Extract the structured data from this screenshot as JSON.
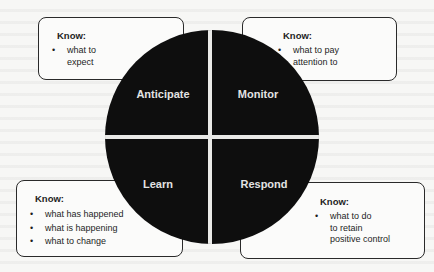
{
  "diagram": {
    "quadrants": [
      {
        "id": "anticipate",
        "label": "Anticipate"
      },
      {
        "id": "monitor",
        "label": "Monitor"
      },
      {
        "id": "learn",
        "label": "Learn"
      },
      {
        "id": "respond",
        "label": "Respond"
      }
    ],
    "boxes": {
      "anticipate": {
        "title": "Know:",
        "items": [
          "what to expect"
        ],
        "lines": [
          "what to",
          "expect"
        ]
      },
      "monitor": {
        "title": "Know:",
        "items": [
          "what to pay attention to"
        ],
        "lines": [
          "what to pay",
          "attention to"
        ]
      },
      "learn": {
        "title": "Know:",
        "items": [
          "what has happened",
          "what is happening",
          "what to change"
        ]
      },
      "respond": {
        "title": "Know:",
        "items": [
          "what to do to retain positive control"
        ],
        "lines": [
          "what to do",
          "to retain",
          "positive control"
        ]
      }
    },
    "colors": {
      "circle": "#0e0e0e",
      "label": "#e3e3e3",
      "box_border": "#2a2a2a",
      "background": "#f7f7f5"
    }
  }
}
